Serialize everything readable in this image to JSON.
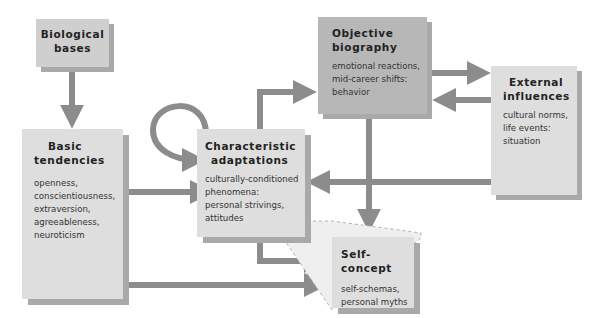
{
  "diagram": {
    "colors": {
      "arrow": "#8c8c8c",
      "box_light": "#dedede",
      "box_mid": "#cfcfcf",
      "box_dark": "#b7b7b7",
      "shadow": "#a9a9a9"
    },
    "nodes": {
      "biological": {
        "title_line1": "Biological",
        "title_line2": "bases"
      },
      "basic": {
        "title_line1": "Basic",
        "title_line2": "tendencies",
        "items": [
          "openness,",
          "conscientiousness,",
          "extraversion,",
          "agreeableness,",
          "neuroticism"
        ]
      },
      "characteristic": {
        "title_line1": "Characteristic",
        "title_line2": "adaptations",
        "items": [
          "culturally-conditioned",
          "phenomena:",
          "personal strivings,",
          "attitudes"
        ]
      },
      "objective": {
        "title_line1": "Objective",
        "title_line2": "biography",
        "items": [
          "emotional reactions,",
          "mid-career shifts:",
          "behavior"
        ]
      },
      "external": {
        "title_line1": "External",
        "title_line2": "influences",
        "items": [
          "cultural norms,",
          "life events:",
          "situation"
        ]
      },
      "selfconcept": {
        "title_line1": "Self-concept",
        "items": [
          "self-schemas,",
          "personal myths"
        ]
      }
    },
    "edges": [
      {
        "from": "biological",
        "to": "basic"
      },
      {
        "from": "basic",
        "to": "characteristic"
      },
      {
        "from": "basic",
        "to": "selfconcept"
      },
      {
        "from": "characteristic",
        "to": "characteristic"
      },
      {
        "from": "characteristic",
        "to": "objective"
      },
      {
        "from": "characteristic",
        "to": "selfconcept"
      },
      {
        "from": "objective",
        "to": "external"
      },
      {
        "from": "external",
        "to": "objective"
      },
      {
        "from": "external",
        "to": "characteristic"
      },
      {
        "from": "objective",
        "to": "selfconcept"
      }
    ]
  }
}
